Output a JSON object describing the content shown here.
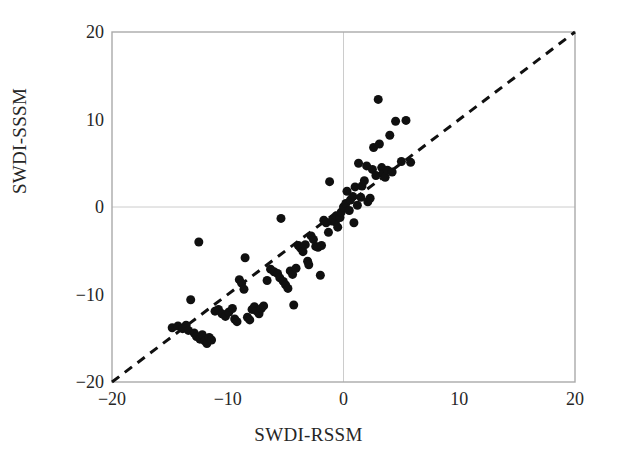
{
  "chart_data": {
    "type": "scatter",
    "title": "",
    "xlabel": "SWDI-RSSM",
    "ylabel": "SWDI-SSSM",
    "xlim": [
      -20,
      20
    ],
    "ylim": [
      -20,
      20
    ],
    "xticks": [
      -20,
      -10,
      0,
      10,
      20
    ],
    "yticks": [
      -20,
      -10,
      0,
      10,
      20
    ],
    "xticklabels": [
      "−20",
      "−10",
      "0",
      "10",
      "20"
    ],
    "yticklabels": [
      "−20",
      "−10",
      "0",
      "10",
      "20"
    ],
    "grid": true,
    "grid_at": [
      0
    ],
    "legend": "none",
    "marker": {
      "shape": "circle",
      "color": "#101010",
      "size": 9
    },
    "reference_line": {
      "name": "1:1 line",
      "style": "dashed",
      "color": "#101010",
      "from": [
        -20,
        -20
      ],
      "to": [
        20,
        20
      ]
    },
    "series": [
      {
        "name": "SWDI comparison",
        "points": [
          [
            -14.8,
            -13.8
          ],
          [
            -14.3,
            -13.6
          ],
          [
            -13.9,
            -13.9
          ],
          [
            -13.6,
            -13.5
          ],
          [
            -13.4,
            -14.1
          ],
          [
            -13.2,
            -10.6
          ],
          [
            -12.9,
            -14.4
          ],
          [
            -12.7,
            -14.8
          ],
          [
            -12.5,
            -4.0
          ],
          [
            -12.4,
            -15.1
          ],
          [
            -12.2,
            -14.6
          ],
          [
            -12.0,
            -15.3
          ],
          [
            -11.8,
            -15.6
          ],
          [
            -11.6,
            -14.9
          ],
          [
            -11.4,
            -15.2
          ],
          [
            -11.1,
            -11.9
          ],
          [
            -10.8,
            -11.7
          ],
          [
            -10.5,
            -12.2
          ],
          [
            -10.2,
            -12.5
          ],
          [
            -9.9,
            -12.0
          ],
          [
            -9.6,
            -11.6
          ],
          [
            -9.4,
            -12.8
          ],
          [
            -9.2,
            -13.1
          ],
          [
            -9.0,
            -8.3
          ],
          [
            -8.8,
            -8.7
          ],
          [
            -8.6,
            -9.4
          ],
          [
            -8.5,
            -5.8
          ],
          [
            -8.3,
            -12.6
          ],
          [
            -8.1,
            -12.9
          ],
          [
            -7.9,
            -11.7
          ],
          [
            -7.7,
            -11.4
          ],
          [
            -7.5,
            -11.9
          ],
          [
            -7.3,
            -12.2
          ],
          [
            -7.1,
            -11.6
          ],
          [
            -6.9,
            -11.3
          ],
          [
            -6.6,
            -8.4
          ],
          [
            -6.3,
            -7.1
          ],
          [
            -6.0,
            -7.4
          ],
          [
            -5.7,
            -7.6
          ],
          [
            -5.5,
            -8.1
          ],
          [
            -5.4,
            -1.3
          ],
          [
            -5.2,
            -8.5
          ],
          [
            -5.0,
            -8.9
          ],
          [
            -4.8,
            -9.3
          ],
          [
            -4.6,
            -7.3
          ],
          [
            -4.4,
            -7.7
          ],
          [
            -4.3,
            -11.2
          ],
          [
            -4.1,
            -7.0
          ],
          [
            -3.9,
            -4.4
          ],
          [
            -3.7,
            -4.7
          ],
          [
            -3.5,
            -5.1
          ],
          [
            -3.3,
            -4.3
          ],
          [
            -3.1,
            -6.2
          ],
          [
            -3.0,
            -6.6
          ],
          [
            -2.8,
            -3.3
          ],
          [
            -2.6,
            -3.7
          ],
          [
            -2.4,
            -4.5
          ],
          [
            -2.2,
            -4.6
          ],
          [
            -2.0,
            -7.8
          ],
          [
            -1.9,
            -4.4
          ],
          [
            -1.7,
            -1.5
          ],
          [
            -1.5,
            -1.8
          ],
          [
            -1.3,
            -2.9
          ],
          [
            -1.2,
            2.9
          ],
          [
            -1.0,
            -1.6
          ],
          [
            -0.9,
            -1.4
          ],
          [
            -0.7,
            -1.7
          ],
          [
            -0.6,
            -1.0
          ],
          [
            -0.5,
            -2.3
          ],
          [
            -0.3,
            -1.2
          ],
          [
            -0.2,
            -0.6
          ],
          [
            0.0,
            0.0
          ],
          [
            0.2,
            0.4
          ],
          [
            0.3,
            1.8
          ],
          [
            0.5,
            -0.4
          ],
          [
            0.6,
            0.8
          ],
          [
            0.8,
            1.2
          ],
          [
            0.9,
            -1.8
          ],
          [
            1.0,
            2.3
          ],
          [
            1.2,
            0.2
          ],
          [
            1.3,
            5.0
          ],
          [
            1.5,
            1.1
          ],
          [
            1.6,
            2.4
          ],
          [
            1.8,
            3.0
          ],
          [
            2.0,
            4.7
          ],
          [
            2.1,
            0.6
          ],
          [
            2.3,
            1.0
          ],
          [
            2.5,
            4.3
          ],
          [
            2.6,
            6.8
          ],
          [
            2.8,
            3.6
          ],
          [
            3.0,
            12.3
          ],
          [
            3.1,
            7.2
          ],
          [
            3.3,
            4.5
          ],
          [
            3.4,
            3.8
          ],
          [
            3.6,
            3.4
          ],
          [
            3.8,
            4.2
          ],
          [
            4.0,
            8.2
          ],
          [
            4.2,
            4.0
          ],
          [
            4.5,
            9.8
          ],
          [
            5.0,
            5.2
          ],
          [
            5.4,
            9.9
          ],
          [
            5.8,
            5.1
          ]
        ]
      }
    ]
  },
  "axes": {
    "frame_color": "#aaaaaa",
    "grid_color": "#cccccc"
  }
}
